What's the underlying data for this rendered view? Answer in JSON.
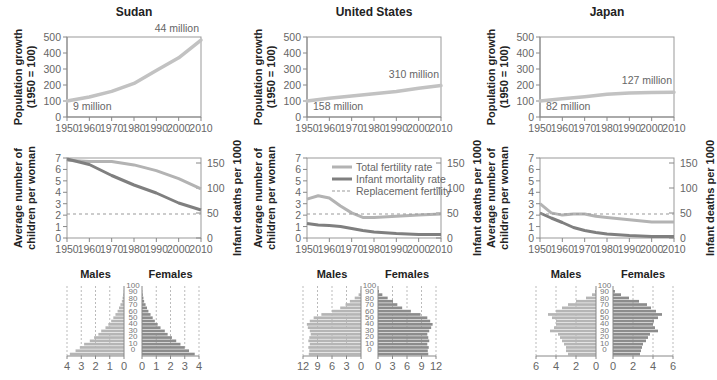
{
  "chart_data": [
    {
      "panel": "Sudan",
      "title": "Sudan",
      "population_growth": {
        "type": "line",
        "ylabel": "Population growth (1950 = 100)",
        "ylim": [
          0,
          500
        ],
        "yticks": [
          0,
          100,
          200,
          300,
          400,
          500
        ],
        "x": [
          1950,
          1960,
          1970,
          1980,
          1990,
          2000,
          2010
        ],
        "values": [
          100,
          125,
          160,
          210,
          290,
          370,
          480
        ],
        "annotations": {
          "start": "9 million",
          "end": "44 million"
        }
      },
      "fertility_mortality": {
        "type": "line",
        "ylabel_left": "Average number of children per woman",
        "ylabel_right": "Infant deaths per 1000",
        "ylim_left": [
          0,
          7
        ],
        "ylim_right": [
          0,
          160
        ],
        "yticks_left": [
          0,
          1,
          2,
          3,
          4,
          5,
          6,
          7
        ],
        "yticks_right": [
          0,
          50,
          100,
          150
        ],
        "x": [
          1950,
          1960,
          1970,
          1980,
          1990,
          2000,
          2010
        ],
        "series": [
          {
            "name": "Total fertility rate",
            "axis": "left",
            "values": [
              6.8,
              6.7,
              6.7,
              6.4,
              5.9,
              5.2,
              4.3
            ]
          },
          {
            "name": "Infant mortality rate",
            "axis": "right",
            "values": [
              158,
              147,
              125,
              106,
              90,
              70,
              56
            ]
          },
          {
            "name": "Replacement fertility",
            "axis": "left",
            "values": [
              2.1,
              2.1,
              2.1,
              2.1,
              2.1,
              2.1,
              2.1
            ]
          }
        ]
      },
      "pyramid": {
        "type": "bar",
        "xmax": 4,
        "xticks_male": [
          4,
          3,
          2,
          1,
          0
        ],
        "xticks_female": [
          0,
          1,
          2,
          3,
          4
        ],
        "age_ticks": [
          0,
          10,
          20,
          30,
          40,
          50,
          60,
          70,
          80,
          90,
          100
        ],
        "male": [
          3.8,
          3.4,
          3.1,
          2.8,
          2.4,
          2.1,
          1.8,
          1.6,
          1.3,
          1.1,
          0.9,
          0.75,
          0.6,
          0.45,
          0.35,
          0.25,
          0.15,
          0.1,
          0.05,
          0.02
        ],
        "female": [
          3.7,
          3.3,
          3.0,
          2.7,
          2.4,
          2.1,
          1.8,
          1.6,
          1.3,
          1.1,
          0.9,
          0.75,
          0.6,
          0.45,
          0.35,
          0.25,
          0.15,
          0.1,
          0.05,
          0.02
        ]
      }
    },
    {
      "panel": "United States",
      "title": "United States",
      "population_growth": {
        "type": "line",
        "ylabel": "Population growth (1950 = 100)",
        "ylim": [
          0,
          500
        ],
        "yticks": [
          0,
          100,
          200,
          300,
          400,
          500
        ],
        "x": [
          1950,
          1960,
          1970,
          1980,
          1990,
          2000,
          2010
        ],
        "values": [
          100,
          117,
          131,
          145,
          160,
          180,
          196
        ],
        "annotations": {
          "start": "158 million",
          "end": "310 million"
        }
      },
      "fertility_mortality": {
        "type": "line",
        "ylabel_left": "Average number of children per woman",
        "ylabel_right": "Infant deaths per 1000",
        "ylim_left": [
          0,
          7
        ],
        "ylim_right": [
          0,
          160
        ],
        "yticks_left": [
          0,
          1,
          2,
          3,
          4,
          5,
          6,
          7
        ],
        "yticks_right": [
          0,
          50,
          100,
          150
        ],
        "x": [
          1950,
          1955,
          1960,
          1965,
          1970,
          1975,
          1980,
          1990,
          2000,
          2010
        ],
        "series": [
          {
            "name": "Total fertility rate",
            "axis": "left",
            "values": [
              3.4,
              3.7,
              3.5,
              2.8,
              2.2,
              1.8,
              1.8,
              1.9,
              2.0,
              2.1
            ]
          },
          {
            "name": "Infant mortality rate",
            "axis": "right",
            "values": [
              29,
              26,
              25,
              23,
              19,
              15,
              12,
              9,
              7,
              7
            ]
          },
          {
            "name": "Replacement fertility",
            "axis": "left",
            "values": [
              2.1,
              2.1,
              2.1,
              2.1,
              2.1,
              2.1,
              2.1,
              2.1,
              2.1,
              2.1
            ]
          }
        ]
      },
      "pyramid": {
        "type": "bar",
        "xmax": 12,
        "xticks_male": [
          12,
          9,
          6,
          3,
          0
        ],
        "xticks_female": [
          0,
          3,
          6,
          9,
          12
        ],
        "age_ticks": [
          0,
          10,
          20,
          30,
          40,
          50,
          60,
          70,
          80,
          90,
          100
        ],
        "male": [
          10.8,
          10.7,
          10.9,
          10.6,
          10.9,
          10.7,
          10.4,
          10.6,
          11.0,
          11.2,
          10.6,
          9.8,
          8.2,
          6.0,
          4.3,
          3.2,
          2.3,
          1.3,
          0.5,
          0.1
        ],
        "female": [
          10.4,
          10.3,
          10.5,
          10.2,
          10.6,
          10.4,
          10.2,
          10.6,
          11.0,
          11.3,
          10.8,
          10.2,
          8.8,
          6.8,
          5.0,
          4.0,
          3.1,
          2.0,
          0.9,
          0.2
        ]
      }
    },
    {
      "panel": "Japan",
      "title": "Japan",
      "population_growth": {
        "type": "line",
        "ylabel": "Population growth (1950 = 100)",
        "ylim": [
          0,
          500
        ],
        "yticks": [
          0,
          100,
          200,
          300,
          400,
          500
        ],
        "x": [
          1950,
          1960,
          1970,
          1980,
          1990,
          2000,
          2010
        ],
        "values": [
          100,
          114,
          127,
          142,
          150,
          154,
          155
        ],
        "annotations": {
          "start": "82 million",
          "end": "127 million"
        }
      },
      "fertility_mortality": {
        "type": "line",
        "ylabel_left": "Average number of children per woman",
        "ylabel_right": "Infant deaths per 1000",
        "ylim_left": [
          0,
          7
        ],
        "ylim_right": [
          0,
          160
        ],
        "yticks_left": [
          0,
          1,
          2,
          3,
          4,
          5,
          6,
          7
        ],
        "yticks_right": [
          0,
          50,
          100,
          150
        ],
        "x": [
          1950,
          1955,
          1960,
          1965,
          1970,
          1975,
          1980,
          1990,
          2000,
          2010
        ],
        "series": [
          {
            "name": "Total fertility rate",
            "axis": "left",
            "values": [
              3.0,
              2.2,
              2.0,
              2.1,
              2.1,
              1.9,
              1.8,
              1.6,
              1.4,
              1.4
            ]
          },
          {
            "name": "Infant mortality rate",
            "axis": "right",
            "values": [
              50,
              40,
              31,
              21,
              15,
              11,
              8,
              5,
              3,
              3
            ]
          },
          {
            "name": "Replacement fertility",
            "axis": "left",
            "values": [
              2.1,
              2.1,
              2.1,
              2.1,
              2.1,
              2.1,
              2.1,
              2.1,
              2.1,
              2.1
            ]
          }
        ]
      },
      "pyramid": {
        "type": "bar",
        "xmax": 6,
        "xticks_male": [
          6,
          4,
          2,
          0
        ],
        "xticks_female": [
          0,
          2,
          4,
          6
        ],
        "age_ticks": [
          0,
          10,
          20,
          30,
          40,
          50,
          60,
          70,
          80,
          90,
          100
        ],
        "male": [
          2.8,
          3.0,
          3.0,
          3.2,
          3.4,
          3.6,
          3.8,
          4.6,
          4.2,
          4.0,
          4.0,
          4.4,
          4.8,
          4.0,
          3.4,
          2.8,
          2.0,
          1.0,
          0.4,
          0.1
        ],
        "female": [
          2.7,
          2.8,
          2.9,
          3.0,
          3.3,
          3.5,
          3.7,
          4.5,
          4.2,
          4.0,
          4.1,
          4.5,
          4.9,
          4.3,
          3.8,
          3.4,
          2.6,
          1.6,
          0.8,
          0.2
        ]
      }
    }
  ],
  "labels": {
    "pop_ylabel_line1": "Population growth",
    "pop_ylabel_line2": "(1950 = 100)",
    "fert_ylabel_line1": "Average number of",
    "fert_ylabel_line2": "children per woman",
    "infant_ylabel": "Infant deaths per 1000",
    "males": "Males",
    "females": "Females",
    "x_years": [
      "1950",
      "1960",
      "1970",
      "1980",
      "1990",
      "2000",
      "2010"
    ]
  },
  "legend": {
    "items": [
      {
        "name": "Total fertility rate",
        "style": "light-solid"
      },
      {
        "name": "Infant mortality rate",
        "style": "dark-solid"
      },
      {
        "name": "Replacement fertility",
        "style": "dashed"
      }
    ]
  },
  "colors": {
    "fertility": "#b3b3b3",
    "mortality": "#7f7f7f",
    "replacement": "#999999",
    "population": "#c2c2c2",
    "male_bar": "#b5b5b5",
    "female_bar": "#8c8c8c",
    "axis": "#888888",
    "title": "#222222"
  }
}
